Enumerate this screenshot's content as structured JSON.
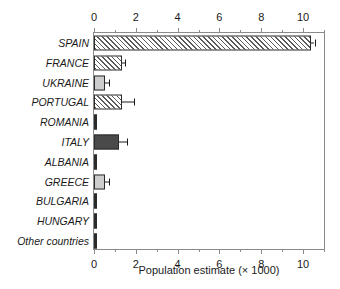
{
  "chart_data": {
    "type": "bar",
    "orientation": "horizontal",
    "title": "",
    "xlabel": "Population estimate (× 1000)",
    "ylabel": "",
    "xlim": [
      0,
      11.1
    ],
    "xticks_major": [
      0,
      2,
      4,
      6,
      8,
      10
    ],
    "xticks_minor": [
      1,
      3,
      5,
      7,
      9,
      11
    ],
    "xtick_labels": [
      "0",
      "2",
      "4",
      "6",
      "8",
      "10"
    ],
    "axis_top": true,
    "axis_bottom": true,
    "grid": false,
    "legend": null,
    "categories": [
      "SPAIN",
      "FRANCE",
      "UKRAINE",
      "PORTUGAL",
      "ROMANIA",
      "ITALY",
      "ALBANIA",
      "GREECE",
      "BULGARIA",
      "HUNGARY",
      "Other countries"
    ],
    "values": [
      10.4,
      1.35,
      0.55,
      1.35,
      0.05,
      1.2,
      0.05,
      0.55,
      0.04,
      0.04,
      0.04
    ],
    "error_high": [
      10.55,
      1.5,
      0.72,
      1.9,
      0.05,
      1.6,
      0.05,
      0.72,
      0.04,
      0.04,
      0.04
    ],
    "bar_styles": [
      "hatch",
      "hatch",
      "solid-light",
      "hatch",
      "sliver",
      "solid-dark",
      "sliver",
      "solid-light",
      "sliver",
      "sliver",
      "sliver"
    ],
    "colors": {
      "hatch_line": "#5a5a5a",
      "solid_light": "#cdcdcd",
      "solid_dark": "#4a4a4a",
      "sliver": "#2b2b2b",
      "bar_edge": "#2b2b2b",
      "frame": "#8a8a8a",
      "text": "#1a1a1a",
      "background": "#ffffff"
    }
  }
}
